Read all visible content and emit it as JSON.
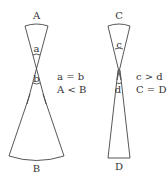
{
  "figures": [
    {
      "id": "left",
      "top_label": "A",
      "upper_angle_label": "a",
      "lower_angle_label": "b",
      "bottom_label": "B",
      "relations": [
        "a = b",
        "A < B"
      ]
    },
    {
      "id": "right",
      "top_label": "C",
      "upper_angle_label": "c",
      "lower_angle_label": "d",
      "bottom_label": "D",
      "relations": [
        "c > d",
        "C = D"
      ]
    }
  ],
  "colors": {
    "line": "#444444",
    "text": "#333333",
    "background": "#ffffff"
  }
}
